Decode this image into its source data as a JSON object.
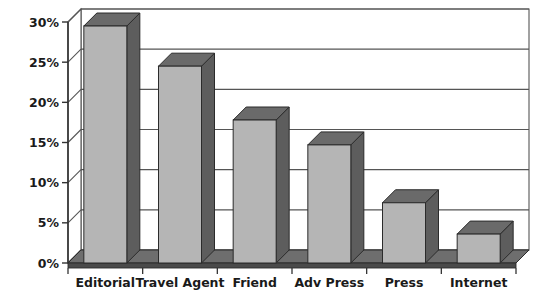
{
  "chart_data": {
    "type": "bar",
    "title": "",
    "subtitle": "",
    "xlabel": "",
    "ylabel": "",
    "categories": [
      "Editorial",
      "Travel Agent",
      "Friend",
      "Adv Press",
      "Press",
      "Internet"
    ],
    "values": [
      29.5,
      24.5,
      17.8,
      14.7,
      7.5,
      3.6
    ],
    "ylim": [
      0,
      30
    ],
    "ytick_labels": [
      "0%",
      "5%",
      "10%",
      "15%",
      "20%",
      "25%",
      "30%"
    ],
    "ytick_values": [
      0,
      5,
      10,
      15,
      20,
      25,
      30
    ],
    "grid": true,
    "legend": null,
    "legend_position": "none",
    "style": "3d-column",
    "colors": {
      "bar_front": "#b5b5b5",
      "bar_side": "#5d5d5d",
      "bar_top": "#6a6a6a",
      "bar_outline": "#2b2b2b",
      "floor": "#6e6e6e",
      "floor_front": "#4a4a4a",
      "wall": "#ffffff",
      "gridline": "#555555",
      "axis": "#333333",
      "background": "#ffffff",
      "text": "#1a1a1a"
    }
  }
}
